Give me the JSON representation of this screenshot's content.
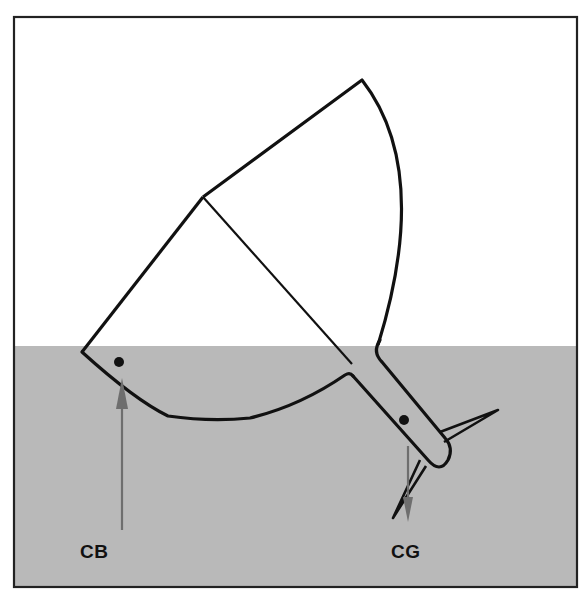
{
  "diagram": {
    "colors": {
      "water": "#b9b9b9",
      "sky": "#ffffff",
      "outline": "#111111",
      "arrow": "#6e6e6e",
      "frame": "#222222"
    },
    "waterline_y": 346,
    "labels": {
      "cb": "CB",
      "cg": "CG"
    },
    "points": {
      "cb": {
        "x": 119,
        "y": 362,
        "arrow_from_y": 530,
        "arrow_dir": "up"
      },
      "cg": {
        "x": 404,
        "y": 420,
        "arrow_to_y": 520,
        "arrow_dir": "down"
      }
    }
  }
}
